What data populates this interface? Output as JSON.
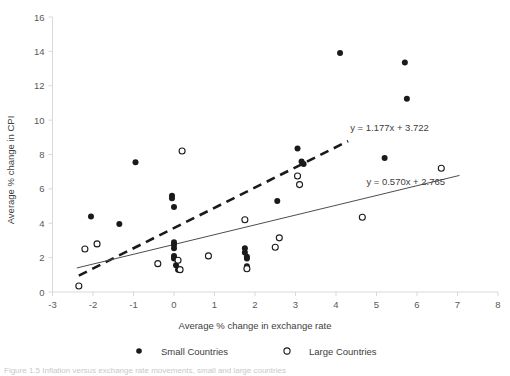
{
  "chart_data": {
    "type": "scatter",
    "title": "",
    "xlabel": "Average % change in exchange rate",
    "ylabel": "Average % change in CPI",
    "xlim": [
      -3,
      8
    ],
    "ylim": [
      0,
      16
    ],
    "xticks": [
      -3,
      -2,
      -1,
      0,
      1,
      2,
      3,
      4,
      5,
      6,
      7,
      8
    ],
    "xtick_labels": [
      "-3",
      "-2",
      "-1",
      "0",
      "1",
      "2",
      "3",
      "4",
      "5",
      "6",
      "7",
      "8"
    ],
    "yticks": [
      0,
      2,
      4,
      6,
      8,
      10,
      12,
      14,
      16
    ],
    "ytick_labels": [
      "0",
      "2",
      "4",
      "6",
      "8",
      "10",
      "12",
      "14",
      "16"
    ],
    "grid": false,
    "legend_position": "bottom",
    "series": [
      {
        "name": "Small Countries",
        "marker": "filled-circle",
        "color": "#1a1a1a",
        "points": [
          [
            -2.05,
            4.4
          ],
          [
            -1.35,
            3.95
          ],
          [
            -0.95,
            7.55
          ],
          [
            -0.05,
            5.6
          ],
          [
            -0.05,
            5.45
          ],
          [
            0.0,
            4.95
          ],
          [
            0.0,
            2.9
          ],
          [
            0.0,
            2.75
          ],
          [
            0.0,
            2.55
          ],
          [
            0.0,
            2.1
          ],
          [
            0.0,
            1.95
          ],
          [
            0.05,
            1.55
          ],
          [
            0.1,
            1.3
          ],
          [
            1.75,
            2.55
          ],
          [
            1.75,
            2.3
          ],
          [
            1.8,
            2.05
          ],
          [
            1.8,
            1.95
          ],
          [
            1.8,
            1.5
          ],
          [
            2.55,
            5.3
          ],
          [
            3.05,
            8.35
          ],
          [
            3.15,
            7.6
          ],
          [
            3.2,
            7.45
          ],
          [
            4.1,
            13.9
          ],
          [
            5.2,
            7.8
          ],
          [
            5.7,
            13.35
          ],
          [
            5.75,
            11.25
          ]
        ]
      },
      {
        "name": "Large Countries",
        "marker": "open-circle",
        "color": "#ffffff",
        "points": [
          [
            -2.35,
            0.35
          ],
          [
            -2.2,
            2.5
          ],
          [
            -1.9,
            2.8
          ],
          [
            -0.4,
            1.65
          ],
          [
            0.1,
            1.85
          ],
          [
            0.15,
            1.3
          ],
          [
            0.2,
            8.2
          ],
          [
            0.85,
            2.1
          ],
          [
            1.75,
            4.2
          ],
          [
            1.8,
            1.35
          ],
          [
            2.5,
            2.6
          ],
          [
            2.6,
            3.15
          ],
          [
            3.05,
            6.75
          ],
          [
            3.1,
            6.25
          ],
          [
            4.65,
            4.35
          ],
          [
            6.6,
            7.2
          ]
        ]
      }
    ],
    "trendlines": [
      {
        "name": "small-countries-trendline",
        "style": "dashed",
        "slope": 1.177,
        "intercept": 3.722,
        "equation": "y = 1.177x + 3.722",
        "x_start": -2.35,
        "x_end": 4.3,
        "label_x": 4.35,
        "label_y": 9.35
      },
      {
        "name": "large-countries-trendline",
        "style": "solid",
        "slope": 0.57,
        "intercept": 2.765,
        "equation": "y = 0.570x + 2.765",
        "x_start": -2.4,
        "x_end": 7.05,
        "label_x": 4.75,
        "label_y": 6.25
      }
    ]
  },
  "legend": {
    "items": [
      {
        "label": "Small Countries",
        "marker": "filled-circle"
      },
      {
        "label": "Large Countries",
        "marker": "open-circle"
      }
    ]
  },
  "caption": {
    "text": "Figure 1.5 Inflation versus exchange rate movements, small and large countries"
  }
}
